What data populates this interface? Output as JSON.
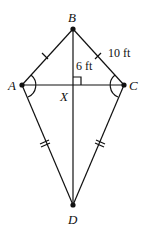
{
  "diagram": {
    "type": "kite",
    "vertices": {
      "A": {
        "label": "A",
        "x": 22,
        "y": 85
      },
      "B": {
        "label": "B",
        "x": 73,
        "y": 29
      },
      "C": {
        "label": "C",
        "x": 124,
        "y": 85
      },
      "D": {
        "label": "D",
        "x": 73,
        "y": 205
      },
      "X": {
        "label": "X",
        "x": 73,
        "y": 85
      }
    },
    "measurements": {
      "BX": "6 ft",
      "BC": "10 ft"
    },
    "markings": {
      "AB_BC": "single tick marks (congruent)",
      "AD_CD": "double tick marks (congruent)",
      "angle_A_angle_C": "single arcs (congruent angles)",
      "right_angle_at_X": true
    },
    "colors": {
      "stroke": "#111111",
      "background": "#ffffff"
    }
  }
}
